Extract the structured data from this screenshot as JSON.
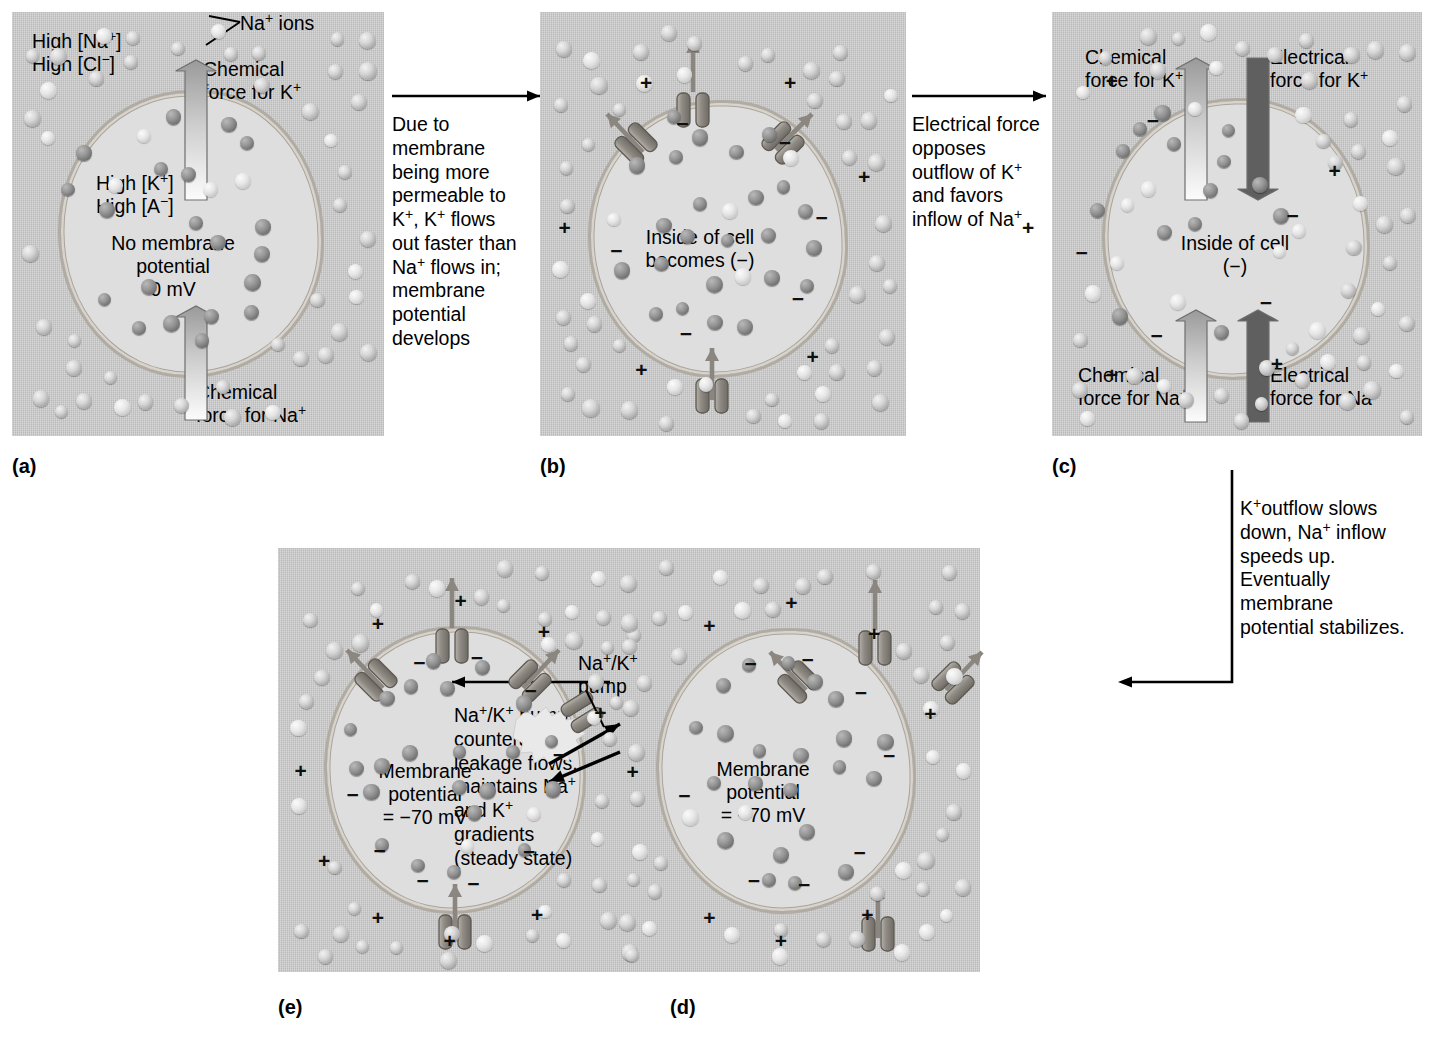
{
  "figure": {
    "panel_captions": [
      "(a)",
      "(b)",
      "(c)",
      "(d)",
      "(e)"
    ]
  },
  "panels": {
    "a": {
      "caption": "(a)",
      "labels": {
        "outside_conc": "High [Na+]\nHigh [Cl−]",
        "na_ions_callout": "Na+ ions",
        "chem_force_k": "Chemical\nforce for K+",
        "inside_conc": "High [K+]\nHigh [A−]",
        "center": "No membrane\npotential\n0 mV",
        "chem_force_na": "Chemical\nforce for Na+"
      }
    },
    "b": {
      "caption": "(b)",
      "labels": {
        "center": "Inside of cell\nbecomes (−)"
      }
    },
    "c": {
      "caption": "(c)",
      "labels": {
        "chem_force_k": "Chemical\nforce for K+",
        "elec_force_k": "Electrical\nforce for K+",
        "center": "Inside of cell\n(−)",
        "chem_force_na": "Chemical\nforce for Na+",
        "elec_force_na": "Electrical\nforce for Na+"
      }
    },
    "d": {
      "caption": "(d)",
      "labels": {
        "center": "Membrane\npotential\n= −70 mV"
      }
    },
    "e": {
      "caption": "(e)",
      "labels": {
        "center": "Membrane\npotential\n= −70 mV",
        "pump": "Na+/K+\npump",
        "atp": "ATP"
      }
    }
  },
  "transitions": {
    "a_to_b": "Due to\nmembrane\nbeing more\npermeable to\nK+, K+ flows\nout faster than\nNa+ flows in;\nmembrane\npotential\ndevelops",
    "b_to_c": "Electrical force\nopposes\noutflow of K+\nand favors\ninflow of Na+",
    "c_to_d": "K+outflow slows\ndown, Na+ inflow\nspeeds up.\nEventually\nmembrane\npotential stabilizes.",
    "d_to_e": "Na+/K+ pump\ncounteracts\nleakage flows,\nmaintains Na+\nand K+\ngradients\n(steady state)"
  },
  "legend": {
    "chemical_force_color": "#e8e8e8",
    "electrical_force_color": "#5a5a5a",
    "membrane_color": "#b0aca4",
    "panel_background": "#c8c8c8",
    "cytoplasm_color": "#dedede"
  }
}
